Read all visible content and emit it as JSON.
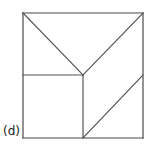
{
  "figure": {
    "label": "(d)",
    "caption_label": "(d)",
    "kind": "tangram-square-dissection",
    "background_color": "#ffffff",
    "stroke_color": "#555555",
    "outline_color": "#4a4a4a",
    "stroke_width": 1.2,
    "canvas": {
      "width": 150,
      "height": 150
    }
  },
  "chart_data": {
    "type": "diagram",
    "title": "(d)",
    "shape": "square",
    "square": {
      "x_left": 23,
      "y_top": 13,
      "x_right": 143,
      "y_bottom": 138,
      "width": 120,
      "height": 125
    },
    "key_points": {
      "top_left": [
        23,
        13
      ],
      "top_right": [
        143,
        13
      ],
      "bottom_left": [
        23,
        138
      ],
      "bottom_right": [
        143,
        138
      ],
      "center": [
        83,
        75
      ],
      "left_mid": [
        23,
        75
      ],
      "right_mid": [
        143,
        75
      ],
      "bottom_mid": [
        83,
        138
      ]
    },
    "outline_segments": [
      {
        "name": "top-edge",
        "from": [
          23,
          13
        ],
        "to": [
          143,
          13
        ]
      },
      {
        "name": "right-edge",
        "from": [
          143,
          13
        ],
        "to": [
          143,
          138
        ]
      },
      {
        "name": "bottom-edge",
        "from": [
          143,
          138
        ],
        "to": [
          23,
          138
        ]
      },
      {
        "name": "left-edge",
        "from": [
          23,
          138
        ],
        "to": [
          23,
          13
        ]
      }
    ],
    "interior_segments": [
      {
        "name": "diagonal-topleft-to-center",
        "from": [
          23,
          13
        ],
        "to": [
          83,
          75
        ]
      },
      {
        "name": "diagonal-topright-to-center",
        "from": [
          143,
          13
        ],
        "to": [
          83,
          75
        ]
      },
      {
        "name": "horizontal-leftmid-to-center",
        "from": [
          23,
          75
        ],
        "to": [
          83,
          75
        ]
      },
      {
        "name": "vertical-center-to-bottommid",
        "from": [
          83,
          75
        ],
        "to": [
          83,
          138
        ]
      },
      {
        "name": "diagonal-bottommid-to-rightmid",
        "from": [
          83,
          138
        ],
        "to": [
          143,
          75
        ]
      }
    ]
  }
}
